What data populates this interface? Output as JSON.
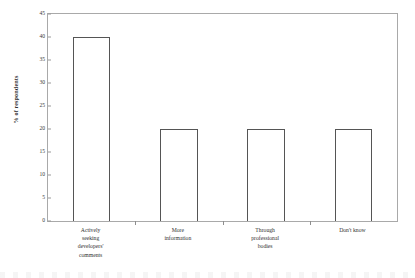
{
  "chart_data": {
    "type": "bar",
    "title": "",
    "xlabel": "",
    "ylabel": "% of respondents",
    "categories": [
      "Actively seeking developers' comments",
      "More information",
      "Through professional bodies",
      "Don't know"
    ],
    "category_lines": [
      [
        "Actively",
        "seeking",
        "developers'",
        "comments"
      ],
      [
        "More",
        "information"
      ],
      [
        "Through",
        "professional",
        "bodies"
      ],
      [
        "Don't know"
      ]
    ],
    "values": [
      40,
      20,
      20,
      20
    ],
    "ylim": [
      0,
      45
    ],
    "ytick_labels": [
      "0",
      "5",
      "10",
      "15",
      "20",
      "25",
      "30",
      "35",
      "40",
      "45"
    ],
    "ytick_values": [
      0,
      5,
      10,
      15,
      20,
      25,
      30,
      35,
      40,
      45
    ],
    "grid": false,
    "legend": false,
    "legend_position": "none",
    "bar_fill_color": "#ffffff",
    "bar_border_color": "#555555",
    "frame_color": "#a9a9a9",
    "background_color": "#ffffff",
    "text_color": "#2f2f2f"
  }
}
